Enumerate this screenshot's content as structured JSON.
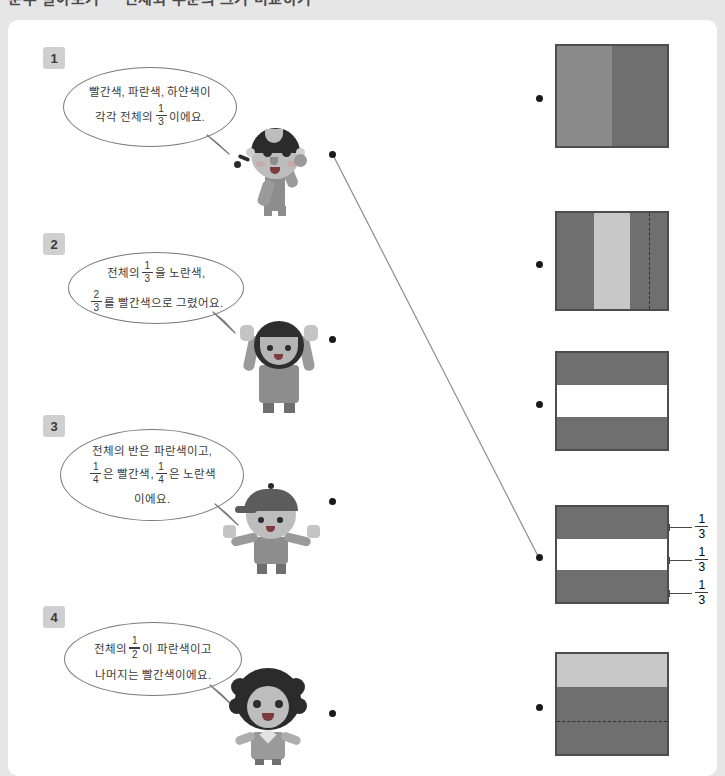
{
  "header": {
    "title_cut_off": "분수 알아보기 ㅡ 전체와 부분의 크기 비교하기"
  },
  "worksheet": {
    "items": [
      {
        "number": "1",
        "badge": "1",
        "speech_lines": [
          {
            "pre": "빨간색, 파란색, 하얀색이",
            "frac": null,
            "post": ""
          },
          {
            "pre": "각각 전체의",
            "frac": {
              "num": "1",
              "den": "3"
            },
            "post": "이에요."
          }
        ],
        "character": "girl-braids-waving",
        "connector_dot": "left-dot-1"
      },
      {
        "number": "2",
        "badge": "2",
        "speech_lines": [
          {
            "pre": "전체의",
            "frac": {
              "num": "1",
              "den": "3"
            },
            "post": "을 노란색,"
          },
          {
            "pre": "",
            "frac": {
              "num": "2",
              "den": "3"
            },
            "post": "를 빨간색으로 그렸어요."
          }
        ],
        "character": "boy-arms-up",
        "connector_dot": "left-dot-2"
      },
      {
        "number": "3",
        "badge": "3",
        "speech_lines": [
          {
            "pre": "전체의 반은 파란색이고,",
            "frac": null,
            "post": ""
          },
          {
            "pre": "",
            "frac": {
              "num": "1",
              "den": "4"
            },
            "post": "은 빨간색,",
            "frac2": {
              "num": "1",
              "den": "4"
            },
            "post2": "은 노란색"
          },
          {
            "pre": "이에요.",
            "frac": null,
            "post": ""
          }
        ],
        "character": "boy-cap-arms-out",
        "connector_dot": "left-dot-3"
      },
      {
        "number": "4",
        "badge": "4",
        "speech_lines": [
          {
            "pre": "전체의",
            "frac": {
              "num": "1",
              "den": "2"
            },
            "post": "이 파란색이고"
          },
          {
            "pre": "나머지는 빨간색이에요.",
            "frac": null,
            "post": ""
          }
        ],
        "character": "girl-curly-hair",
        "connector_dot": "left-dot-4"
      }
    ],
    "figures": [
      {
        "id": "figure-a",
        "description": "square split into two equal vertical halves",
        "orientation": "vertical",
        "bands": [
          {
            "fraction": "1/2",
            "color": "#8a8a8a"
          },
          {
            "fraction": "1/2",
            "color": "#6f6f6f"
          }
        ],
        "dashed_guides": [],
        "labels": []
      },
      {
        "id": "figure-b",
        "description": "square split into three equal vertical thirds, dashed line halves the right third",
        "orientation": "vertical",
        "bands": [
          {
            "fraction": "1/3",
            "color": "#6f6f6f"
          },
          {
            "fraction": "1/3",
            "color": "#c8c8c8"
          },
          {
            "fraction": "1/3",
            "color": "#6f6f6f"
          }
        ],
        "dashed_guides": [
          "vertical-at-83-percent"
        ],
        "labels": []
      },
      {
        "id": "figure-c",
        "description": "square split into three equal horizontal thirds, middle band white",
        "orientation": "horizontal",
        "bands": [
          {
            "fraction": "1/3",
            "color": "#6f6f6f"
          },
          {
            "fraction": "1/3",
            "color": "#ffffff"
          },
          {
            "fraction": "1/3",
            "color": "#6f6f6f"
          }
        ],
        "dashed_guides": [],
        "labels": []
      },
      {
        "id": "figure-d",
        "description": "square split into three equal horizontal thirds with 1/3 callout labels",
        "orientation": "horizontal",
        "bands": [
          {
            "fraction": "1/3",
            "color": "#6f6f6f"
          },
          {
            "fraction": "1/3",
            "color": "#ffffff"
          },
          {
            "fraction": "1/3",
            "color": "#6f6f6f"
          }
        ],
        "dashed_guides": [],
        "labels": [
          {
            "num": "1",
            "den": "3"
          },
          {
            "num": "1",
            "den": "3"
          },
          {
            "num": "1",
            "den": "3"
          }
        ]
      },
      {
        "id": "figure-e",
        "description": "square with light top third and dark lower two-thirds, dashed line halves the dark part",
        "orientation": "horizontal",
        "bands": [
          {
            "fraction": "1/3",
            "color": "#c8c8c8"
          },
          {
            "fraction": "2/3",
            "color": "#6f6f6f"
          }
        ],
        "dashed_guides": [
          "horizontal-at-67-percent"
        ],
        "labels": []
      }
    ],
    "connections": [
      {
        "from": "left-dot-1",
        "to": "right-dot-4",
        "drawn": true
      }
    ],
    "colors": {
      "page_background": "#e6e6e6",
      "card_background": "#ffffff",
      "badge_background": "#cfcfcf",
      "figure_border": "#4d4d4d",
      "dark_band": "#6f6f6f",
      "mid_band": "#8a8a8a",
      "light_band": "#c8c8c8",
      "white_band": "#ffffff",
      "dot": "#1a1a1a",
      "line": "#8c8c8c",
      "text": "#3a3a3a"
    }
  }
}
